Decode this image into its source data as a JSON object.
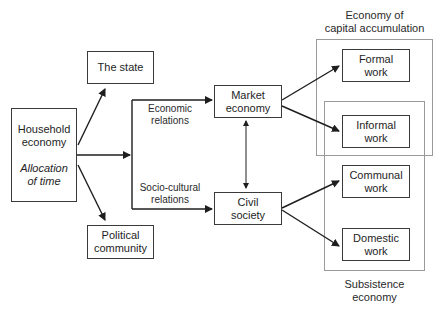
{
  "diagram": {
    "nodes": {
      "household": {
        "line1": "Household",
        "line2": "economy",
        "sub1": "Allocation",
        "sub2": "of time"
      },
      "state": {
        "line1": "The state"
      },
      "political": {
        "line1": "Political",
        "line2": "community"
      },
      "market": {
        "line1": "Market",
        "line2": "economy"
      },
      "civil": {
        "line1": "Civil",
        "line2": "society"
      },
      "formal": {
        "line1": "Formal",
        "line2": "work"
      },
      "informal": {
        "line1": "Informal",
        "line2": "work"
      },
      "communal": {
        "line1": "Communal",
        "line2": "work"
      },
      "domestic": {
        "line1": "Domestic",
        "line2": "work"
      }
    },
    "edge_labels": {
      "economic": {
        "line1": "Economic",
        "line2": "relations"
      },
      "sociocultural": {
        "line1": "Socio-cultural",
        "line2": "relations"
      }
    },
    "groups": {
      "capital": {
        "line1": "Economy of",
        "line2": "capital accumulation"
      },
      "subsistence": {
        "line1": "Subsistence",
        "line2": "economy"
      }
    },
    "edges": [
      {
        "from": "Household economy",
        "to": "The state"
      },
      {
        "from": "Household economy",
        "to": "Political community"
      },
      {
        "from": "Household economy",
        "to": "Market economy",
        "label": "Economic relations"
      },
      {
        "from": "Household economy",
        "to": "Civil society",
        "label": "Socio-cultural relations"
      },
      {
        "from": "Market economy",
        "to": "Civil society",
        "bidirectional": true
      },
      {
        "from": "Market economy",
        "to": "Formal work"
      },
      {
        "from": "Market economy",
        "to": "Informal work"
      },
      {
        "from": "Civil society",
        "to": "Communal work"
      },
      {
        "from": "Civil society",
        "to": "Domestic work"
      }
    ]
  }
}
